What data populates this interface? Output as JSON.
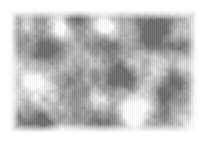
{
  "image": {
    "kind": "grayscale-cloud-noise-texture",
    "title": "Grayscale Cloud Noise Texture",
    "alt_text": "Soft grayscale fractal cloud noise texture with light and dark blobs",
    "canvas_width": 207,
    "canvas_height": 143,
    "content_x": 10,
    "content_y": 10,
    "content_width": 187,
    "content_height": 123,
    "margin_color": "#ffffff",
    "base_color": "#bdbdbd",
    "min_gray": "#6e6e6e",
    "max_gray": "#ffffff",
    "mean_gray": "#bcbcbc",
    "has_vertical_striping": true,
    "stripe_period_px": 2,
    "render": {
      "octaves": 5,
      "base_cell_px": 34,
      "persistence": 0.52,
      "lacunarity": 2.0,
      "seed": 20240517,
      "contrast": 1.22,
      "brightness": 0.06,
      "stripe_amplitude": 0.045
    },
    "bright_blobs": [
      {
        "name": "lower-center-hotspot",
        "cx": 125,
        "cy": 105,
        "radius": 16,
        "intensity": 1.0
      },
      {
        "name": "lower-right-glow",
        "cx": 186,
        "cy": 118,
        "radius": 20,
        "intensity": 0.92
      },
      {
        "name": "upper-right-patch",
        "cx": 168,
        "cy": 22,
        "radius": 14,
        "intensity": 0.85
      },
      {
        "name": "upper-left-patch",
        "cx": 46,
        "cy": 18,
        "radius": 13,
        "intensity": 0.8
      },
      {
        "name": "left-mid-patch",
        "cx": 22,
        "cy": 72,
        "radius": 12,
        "intensity": 0.72
      },
      {
        "name": "top-center-patch",
        "cx": 96,
        "cy": 16,
        "radius": 11,
        "intensity": 0.7
      },
      {
        "name": "bottom-left-patch",
        "cx": 52,
        "cy": 126,
        "radius": 12,
        "intensity": 0.74
      }
    ],
    "dark_blobs": [
      {
        "name": "center-dark-mass",
        "cx": 104,
        "cy": 62,
        "radius": 20,
        "intensity": 0.95
      },
      {
        "name": "upper-left-dark",
        "cx": 36,
        "cy": 40,
        "radius": 17,
        "intensity": 0.85
      },
      {
        "name": "right-mid-dark",
        "cx": 160,
        "cy": 70,
        "radius": 16,
        "intensity": 0.8
      },
      {
        "name": "bottom-center-dark",
        "cx": 96,
        "cy": 122,
        "radius": 15,
        "intensity": 0.78
      },
      {
        "name": "top-right-dark",
        "cx": 140,
        "cy": 26,
        "radius": 13,
        "intensity": 0.7
      },
      {
        "name": "left-lower-dark",
        "cx": 26,
        "cy": 104,
        "radius": 14,
        "intensity": 0.72
      }
    ]
  }
}
